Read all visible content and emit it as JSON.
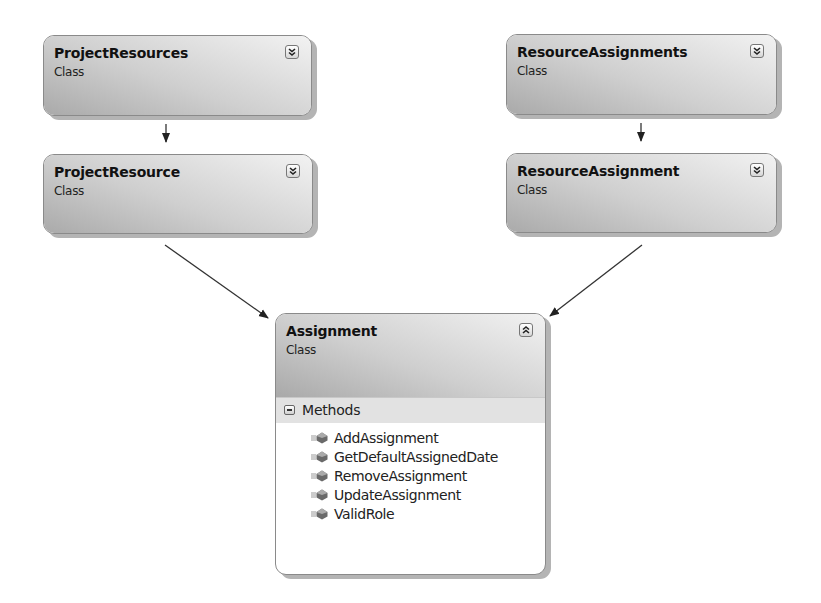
{
  "classes": [
    {
      "id": "ProjectResources",
      "name": "ProjectResources",
      "stereotype": "Class",
      "toggle": "expand-chevrons"
    },
    {
      "id": "ProjectResource",
      "name": "ProjectResource",
      "stereotype": "Class",
      "toggle": "expand-chevrons"
    },
    {
      "id": "ResourceAssignments",
      "name": "ResourceAssignments",
      "stereotype": "Class",
      "toggle": "expand-chevrons"
    },
    {
      "id": "ResourceAssignment",
      "name": "ResourceAssignment",
      "stereotype": "Class",
      "toggle": "expand-chevrons"
    },
    {
      "id": "Assignment",
      "name": "Assignment",
      "stereotype": "Class",
      "toggle": "collapse-chevrons",
      "sections": [
        {
          "label": "Methods",
          "icon": "collapse-minus-icon",
          "members": [
            {
              "name": "AddAssignment",
              "icon": "method-icon"
            },
            {
              "name": "GetDefaultAssignedDate",
              "icon": "method-icon"
            },
            {
              "name": "RemoveAssignment",
              "icon": "method-icon"
            },
            {
              "name": "UpdateAssignment",
              "icon": "method-icon"
            },
            {
              "name": "ValidRole",
              "icon": "method-icon"
            }
          ]
        }
      ]
    }
  ],
  "connectors": [
    {
      "from": "ProjectResources",
      "to": "ProjectResource"
    },
    {
      "from": "ResourceAssignments",
      "to": "ResourceAssignment"
    },
    {
      "from": "ProjectResource",
      "to": "Assignment"
    },
    {
      "from": "ResourceAssignment",
      "to": "Assignment"
    }
  ]
}
